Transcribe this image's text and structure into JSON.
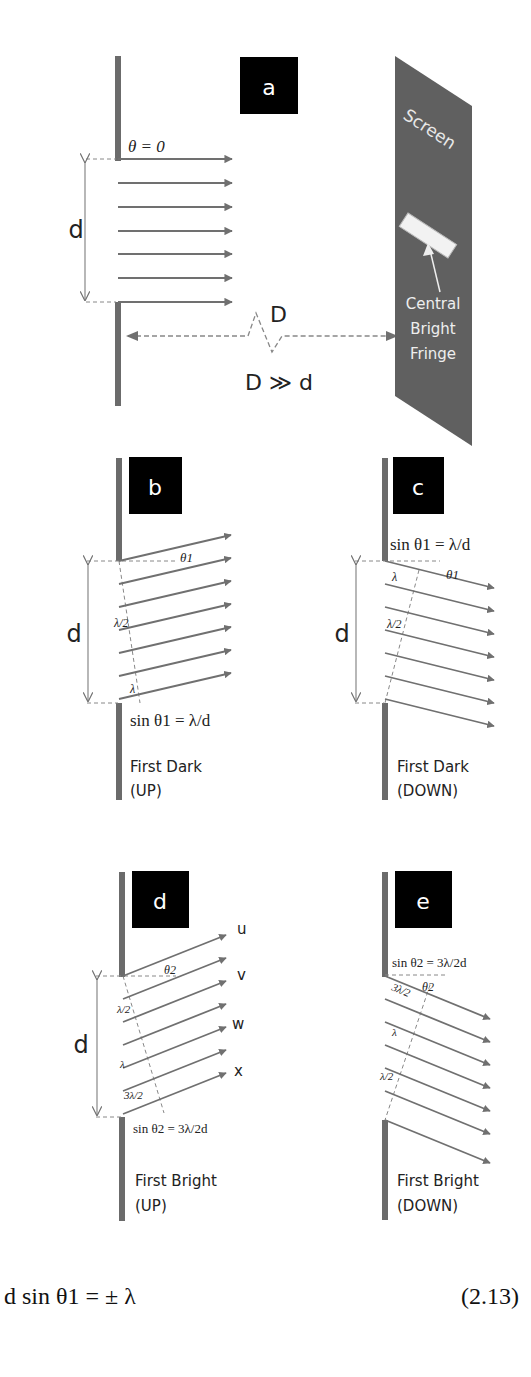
{
  "colors": {
    "wall": "#6b6b6b",
    "ray": "#707070",
    "screen": "#606060",
    "badge": "#000000",
    "text": "#222222",
    "fringe": "#f2f2f2"
  },
  "panel_a": {
    "badge": "a",
    "theta_label": "θ = 0",
    "d_label": "d",
    "D_label": "D",
    "relation": "D ≫ d",
    "screen_label": "Screen",
    "fringe_label_lines": [
      "Central",
      "Bright",
      "Fringe"
    ]
  },
  "panel_b": {
    "badge": "b",
    "d_label": "d",
    "angle_label": "θ1",
    "half_lambda": "λ/2",
    "lambda": "λ",
    "equation": "sin θ1 = λ/d",
    "caption_lines": [
      "First Dark",
      "(UP)"
    ]
  },
  "panel_c": {
    "badge": "c",
    "d_label": "d",
    "angle_label": "θ1",
    "half_lambda": "λ/2",
    "lambda": "λ",
    "equation": "sin θ1 = λ/d",
    "caption_lines": [
      "First Dark",
      "(DOWN)"
    ]
  },
  "panel_d": {
    "badge": "d",
    "d_label": "d",
    "angle_label": "θ2",
    "ray_labels": [
      "u",
      "v",
      "w",
      "x"
    ],
    "half_lambda": "λ/2",
    "lambda": "λ",
    "three_half_lambda": "3λ/2",
    "equation": "sin θ2 = 3λ/2d",
    "caption_lines": [
      "First Bright",
      "(UP)"
    ]
  },
  "panel_e": {
    "badge": "e",
    "angle_label": "θ2",
    "half_lambda": "λ/2",
    "lambda": "λ",
    "three_half_lambda": "3λ/2",
    "equation": "sin θ2 = 3λ/2d",
    "caption_lines": [
      "First Bright",
      "(DOWN)"
    ]
  },
  "footer_equation": {
    "text": "d sin θ1 = ± λ",
    "number": "(2.13)"
  }
}
